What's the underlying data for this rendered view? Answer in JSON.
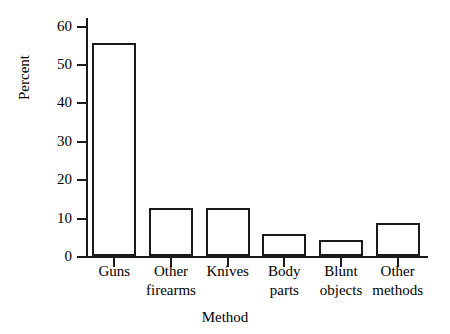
{
  "chart_data": {
    "type": "bar",
    "title": "",
    "xlabel": "Method",
    "ylabel": "Percent",
    "categories": [
      "Guns",
      "Other firearms",
      "Knives",
      "Body parts",
      "Blunt objects",
      "Other methods"
    ],
    "category_lines": [
      [
        "Guns"
      ],
      [
        "Other",
        "firearms"
      ],
      [
        "Knives"
      ],
      [
        "Body",
        "parts"
      ],
      [
        "Blunt",
        "objects"
      ],
      [
        "Other",
        "methods"
      ]
    ],
    "values": [
      55.5,
      12.6,
      12.5,
      5.7,
      4.2,
      8.5
    ],
    "ylim": [
      0,
      62
    ],
    "ytick_labels": [
      "0",
      "10",
      "20",
      "30",
      "40",
      "50",
      "60"
    ],
    "ytick_values": [
      0,
      10,
      20,
      30,
      40,
      50,
      60
    ],
    "grid": false,
    "legend": false,
    "bar_fill_color": "#ffffff",
    "bar_edge_color": "#1a1a1a",
    "axis_color": "#1a1a1a",
    "background_color": "#ffffff"
  }
}
